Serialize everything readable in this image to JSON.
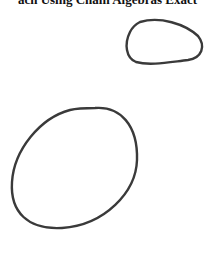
{
  "title": "ach Using Chain Algebras Exact",
  "shapes": [
    {
      "name": "small-rounded-blob",
      "stroke": "#3a3a3a"
    },
    {
      "name": "large-ellipse",
      "stroke": "#3a3a3a"
    }
  ]
}
